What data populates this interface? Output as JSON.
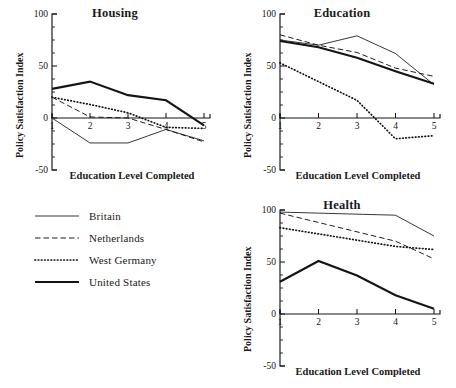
{
  "figure": {
    "axis_y_title": "Policy Satisfaction Index",
    "axis_x_title": "Education Level Completed",
    "y_ticks": [
      "100",
      "50",
      "0",
      "-50"
    ],
    "x_ticks": [
      "1",
      "2",
      "3",
      "4",
      "5"
    ],
    "line_color": "#141414"
  },
  "legend": {
    "items": [
      {
        "label": "Britain",
        "style": "solid-thin"
      },
      {
        "label": "Netherlands",
        "style": "dashed"
      },
      {
        "label": "West Germany",
        "style": "dotted"
      },
      {
        "label": "United States",
        "style": "solid-thick"
      }
    ]
  },
  "chart_data": [
    {
      "type": "line",
      "title": "Housing",
      "xlabel": "Education Level Completed",
      "ylabel": "Policy Satisfaction Index",
      "x": [
        1,
        2,
        3,
        4,
        5
      ],
      "xlim": [
        1,
        5
      ],
      "ylim": [
        -50,
        100
      ],
      "grid": false,
      "legend_position": "external-left",
      "series": [
        {
          "name": "Britain",
          "values": [
            0,
            -24,
            -24,
            -11,
            -22
          ]
        },
        {
          "name": "Netherlands",
          "values": [
            20,
            1,
            0,
            -11,
            -23
          ]
        },
        {
          "name": "West Germany",
          "values": [
            20,
            13,
            5,
            -9,
            -10
          ]
        },
        {
          "name": "United States",
          "values": [
            28,
            35,
            22,
            17,
            -7
          ]
        }
      ]
    },
    {
      "type": "line",
      "title": "Education",
      "xlabel": "Education Level Completed",
      "ylabel": "Policy Satisfaction Index",
      "x": [
        1,
        2,
        3,
        4,
        5
      ],
      "xlim": [
        1,
        5
      ],
      "ylim": [
        -50,
        100
      ],
      "grid": false,
      "legend_position": "external-left",
      "series": [
        {
          "name": "Britain",
          "values": [
            75,
            70,
            79,
            62,
            32
          ]
        },
        {
          "name": "Netherlands",
          "values": [
            80,
            70,
            63,
            48,
            40
          ]
        },
        {
          "name": "West Germany",
          "values": [
            53,
            35,
            17,
            -20,
            -17
          ]
        },
        {
          "name": "United States",
          "values": [
            74,
            68,
            58,
            45,
            33
          ]
        }
      ]
    },
    {
      "type": "line",
      "title": "Health",
      "xlabel": "Education Level Completed",
      "ylabel": "Policy Satisfaction Index",
      "x": [
        1,
        2,
        3,
        4,
        5
      ],
      "xlim": [
        1,
        5
      ],
      "ylim": [
        -50,
        100
      ],
      "grid": false,
      "legend_position": "external-left",
      "series": [
        {
          "name": "Britain",
          "values": [
            98,
            97,
            96,
            95,
            75
          ]
        },
        {
          "name": "Netherlands",
          "values": [
            97,
            88,
            79,
            70,
            53
          ]
        },
        {
          "name": "West Germany",
          "values": [
            83,
            77,
            71,
            65,
            62
          ]
        },
        {
          "name": "United States",
          "values": [
            31,
            51,
            37,
            18,
            5
          ]
        }
      ]
    }
  ]
}
